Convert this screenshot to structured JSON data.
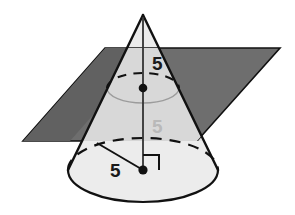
{
  "figure": {
    "name": "cone-with-intersecting-plane",
    "background_color": "#ffffff",
    "width": 295,
    "height": 215
  },
  "labels": {
    "height_upper": "5",
    "height_lower": "5",
    "radius": "5"
  },
  "colors": {
    "plane_dark": "#6e6e6e",
    "plane_shadow": "#5a5a5a",
    "cone_light": "#ececec",
    "cone_mid": "#d8d8d8",
    "cone_upper": "#e4e4e4",
    "outline": "#111111",
    "label_dark": "#1a1a1a",
    "label_light": "#b9b9b9"
  },
  "geometry": {
    "cone": {
      "apex": {
        "x": 143,
        "y": 15
      },
      "base_center": {
        "x": 143,
        "y": 170
      },
      "base_rx": 75,
      "base_ry": 32
    },
    "cross_section": {
      "center": {
        "x": 143,
        "y": 88
      },
      "rx": 36,
      "ry": 15
    },
    "plane": {
      "corner_top_left": {
        "x": 105,
        "y": 48
      },
      "corner_top_right": {
        "x": 280,
        "y": 48
      },
      "corner_bottom_right": {
        "x": 197,
        "y": 141
      },
      "corner_bottom_left": {
        "x": 23,
        "y": 141
      }
    }
  },
  "annotations": {
    "axis_name": "cone-axis",
    "radius_name": "base-radius-segment",
    "right_angle_name": "right-angle-marker",
    "apex_dot_name": "apex-vertex",
    "cross_section_dot_name": "cross-section-center-dot",
    "base_dot_name": "base-center-dot"
  }
}
